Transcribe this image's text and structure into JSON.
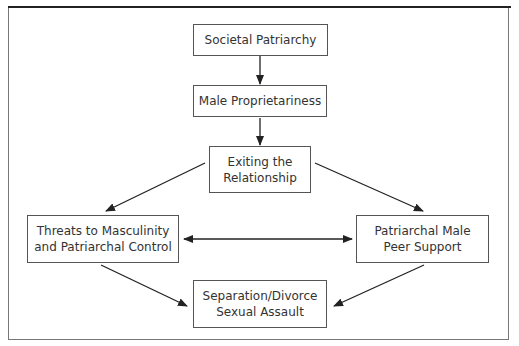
{
  "diagram": {
    "nodes": [
      {
        "id": "societal",
        "label_line1": "Societal Patriarchy",
        "label_line2": ""
      },
      {
        "id": "proprietariness",
        "label_line1": "Male Proprietariness",
        "label_line2": ""
      },
      {
        "id": "exiting",
        "label_line1": "Exiting the",
        "label_line2": "Relationship"
      },
      {
        "id": "threats",
        "label_line1": "Threats to Masculinity",
        "label_line2": "and Patriarchal Control"
      },
      {
        "id": "peer",
        "label_line1": "Patriarchal Male",
        "label_line2": "Peer Support"
      },
      {
        "id": "separation",
        "label_line1": "Separation/Divorce",
        "label_line2": "Sexual Assault"
      }
    ],
    "edges": [
      {
        "from": "societal",
        "to": "proprietariness",
        "type": "directed"
      },
      {
        "from": "proprietariness",
        "to": "exiting",
        "type": "directed"
      },
      {
        "from": "exiting",
        "to": "threats",
        "type": "directed"
      },
      {
        "from": "exiting",
        "to": "peer",
        "type": "directed"
      },
      {
        "from": "threats",
        "to": "peer",
        "type": "bidirectional"
      },
      {
        "from": "threats",
        "to": "separation",
        "type": "directed"
      },
      {
        "from": "peer",
        "to": "separation",
        "type": "directed"
      }
    ]
  }
}
